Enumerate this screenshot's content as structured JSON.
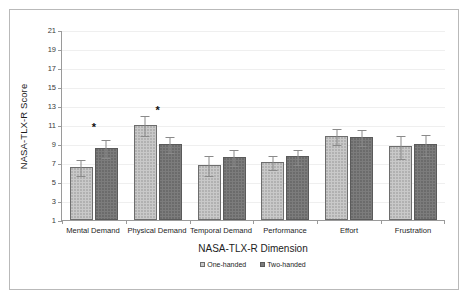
{
  "chart_data": {
    "type": "bar",
    "title": "",
    "xlabel": "NASA-TLX-R Dimension",
    "ylabel": "NASA-TLX-R Score",
    "categories": [
      "Mental Demand",
      "Physical Demand",
      "Temporal Demand",
      "Performance",
      "Effort",
      "Frustration"
    ],
    "ylim": [
      1,
      21
    ],
    "yticks": [
      1,
      3,
      5,
      7,
      9,
      11,
      13,
      15,
      17,
      19,
      21
    ],
    "grid": true,
    "legend_position": "bottom",
    "series": [
      {
        "name": "One-handed",
        "color": "#c9c9c9",
        "values": [
          6.6,
          11.0,
          6.75,
          7.1,
          9.85,
          8.75
        ],
        "errors": [
          0.85,
          1.1,
          1.05,
          0.75,
          0.85,
          1.25
        ]
      },
      {
        "name": "Two-handed",
        "color": "#7c7c7c",
        "values": [
          8.6,
          9.0,
          7.6,
          7.7,
          9.7,
          8.95
        ],
        "errors": [
          0.95,
          0.85,
          0.85,
          0.8,
          0.85,
          1.15
        ]
      }
    ],
    "annotations": [
      {
        "label": "*",
        "category": "Mental Demand",
        "y": 11.4
      },
      {
        "label": "*",
        "category": "Physical Demand",
        "y": 13.2
      }
    ]
  }
}
